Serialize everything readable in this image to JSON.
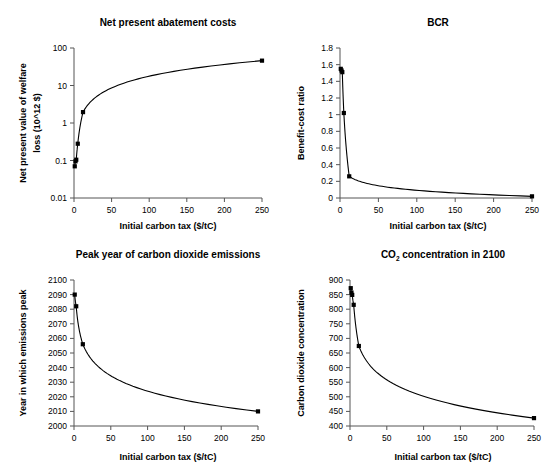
{
  "figure": {
    "name": "four-panel-carbon-tax-figure",
    "background": "#ffffff",
    "axis_color": "#555555",
    "series_color": "#000000",
    "width": 555,
    "height": 472
  },
  "shared": {
    "xlabel": "Initial carbon tax ($/tC)",
    "xticks": [
      "0",
      "50",
      "100",
      "150",
      "200",
      "250"
    ],
    "xlim": [
      0,
      250
    ]
  },
  "chart_data": [
    {
      "id": "net-present-abatement-costs",
      "type": "line",
      "title": "Net present abatement costs",
      "xlabel": "Initial carbon tax ($/tC)",
      "ylabel": "Net present value of welfare loss (10^12 $)",
      "ylabel_line1": "Net present value of welfare",
      "ylabel_line2": "loss (10^12 $)",
      "xlim": [
        0,
        250
      ],
      "ylim": [
        0.01,
        100
      ],
      "yscale": "log",
      "xscale": "linear",
      "grid": false,
      "legend": "none",
      "xticks": [
        "0",
        "50",
        "100",
        "150",
        "200",
        "250"
      ],
      "yticks": [
        "0.01",
        "0.1",
        "1",
        "10",
        "100"
      ],
      "ytick_values": [
        0.01,
        0.1,
        1,
        10,
        100
      ],
      "x": [
        1,
        2,
        3,
        5,
        12,
        250
      ],
      "values": [
        0.07,
        0.095,
        0.105,
        0.28,
        1.95,
        46
      ],
      "points": [
        {
          "x": 1,
          "y": 0.07
        },
        {
          "x": 2,
          "y": 0.095
        },
        {
          "x": 3,
          "y": 0.105
        },
        {
          "x": 5,
          "y": 0.28
        },
        {
          "x": 12,
          "y": 1.95
        },
        {
          "x": 250,
          "y": 46
        }
      ]
    },
    {
      "id": "bcr",
      "type": "line",
      "title": "BCR",
      "xlabel": "Initial carbon tax ($/tC)",
      "ylabel": "Benefit-cost ratio",
      "xlim": [
        0,
        250
      ],
      "ylim": [
        0,
        1.8
      ],
      "yscale": "linear",
      "xscale": "linear",
      "grid": false,
      "legend": "none",
      "xticks": [
        "0",
        "50",
        "100",
        "150",
        "200",
        "250"
      ],
      "yticks": [
        "0",
        "0.2",
        "0.4",
        "0.6",
        "0.8",
        "1",
        "1.2",
        "1.4",
        "1.6",
        "1.8"
      ],
      "ytick_values": [
        0,
        0.2,
        0.4,
        0.6,
        0.8,
        1.0,
        1.2,
        1.4,
        1.6,
        1.8
      ],
      "x": [
        1,
        2,
        3,
        5,
        12,
        250
      ],
      "values": [
        1.55,
        1.53,
        1.51,
        1.02,
        0.26,
        0.02
      ],
      "points": [
        {
          "x": 1,
          "y": 1.55
        },
        {
          "x": 2,
          "y": 1.53
        },
        {
          "x": 3,
          "y": 1.51
        },
        {
          "x": 5,
          "y": 1.02
        },
        {
          "x": 12,
          "y": 0.26
        },
        {
          "x": 250,
          "y": 0.02
        }
      ]
    },
    {
      "id": "peak-year-of-carbon-dioxide-emissions",
      "type": "line",
      "title": "Peak year of carbon dioxide emissions",
      "xlabel": "Initial carbon tax ($/tC)",
      "ylabel": "Year in which emissions peak",
      "xlim": [
        0,
        250
      ],
      "ylim": [
        2000,
        2100
      ],
      "yscale": "linear",
      "xscale": "linear",
      "grid": false,
      "legend": "none",
      "xticks": [
        "0",
        "50",
        "100",
        "150",
        "200",
        "250"
      ],
      "yticks": [
        "2000",
        "2010",
        "2020",
        "2030",
        "2040",
        "2050",
        "2060",
        "2070",
        "2080",
        "2090",
        "2100"
      ],
      "ytick_values": [
        2000,
        2010,
        2020,
        2030,
        2040,
        2050,
        2060,
        2070,
        2080,
        2090,
        2100
      ],
      "x": [
        1,
        3,
        12,
        250
      ],
      "values": [
        2090,
        2082,
        2056,
        2010
      ],
      "points": [
        {
          "x": 1,
          "y": 2090
        },
        {
          "x": 3,
          "y": 2082
        },
        {
          "x": 12,
          "y": 2056
        },
        {
          "x": 250,
          "y": 2010
        }
      ]
    },
    {
      "id": "co2-concentration-in-2100",
      "type": "line",
      "title": "CO2 concentration in 2100",
      "title_main": "CO",
      "title_sub": "2",
      "title_rest": " concentration in 2100",
      "xlabel": "Initial carbon tax ($/tC)",
      "ylabel": "Carbon dioxide concentration",
      "xlim": [
        0,
        250
      ],
      "ylim": [
        400,
        900
      ],
      "yscale": "linear",
      "xscale": "linear",
      "grid": false,
      "legend": "none",
      "xticks": [
        "0",
        "50",
        "100",
        "150",
        "200",
        "250"
      ],
      "yticks": [
        "400",
        "450",
        "500",
        "550",
        "600",
        "650",
        "700",
        "750",
        "800",
        "850",
        "900"
      ],
      "ytick_values": [
        400,
        450,
        500,
        550,
        600,
        650,
        700,
        750,
        800,
        850,
        900
      ],
      "x": [
        1,
        2,
        3,
        5,
        12,
        250
      ],
      "values": [
        872,
        857,
        849,
        815,
        674,
        427
      ],
      "points": [
        {
          "x": 1,
          "y": 872
        },
        {
          "x": 2,
          "y": 857
        },
        {
          "x": 3,
          "y": 849
        },
        {
          "x": 5,
          "y": 815
        },
        {
          "x": 12,
          "y": 674
        },
        {
          "x": 250,
          "y": 427
        }
      ]
    }
  ]
}
